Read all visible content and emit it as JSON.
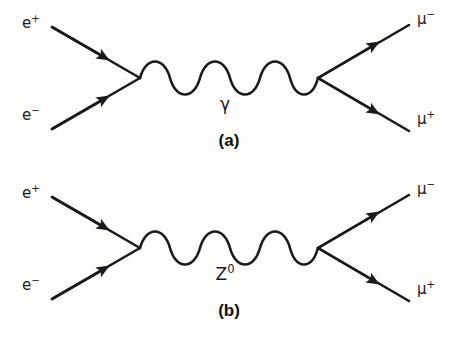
{
  "figure": {
    "background_color": "#fdfdfc",
    "ink_color": "#1a1a1a",
    "process": "e+ e- -> mu+ mu-"
  },
  "diagrams": [
    {
      "id": "a",
      "caption": "(a)",
      "propagator": {
        "particle": "γ",
        "superscript": "",
        "type": "wavy",
        "cycles": 3
      },
      "incoming": [
        {
          "label": "e",
          "charge": "+",
          "position": "upper-left",
          "arrow": "toward-vertex"
        },
        {
          "label": "e",
          "charge": "−",
          "position": "lower-left",
          "arrow": "toward-vertex"
        }
      ],
      "outgoing": [
        {
          "label": "μ",
          "charge": "−",
          "position": "upper-right",
          "arrow": "away-from-vertex"
        },
        {
          "label": "μ",
          "charge": "+",
          "position": "lower-right",
          "arrow": "away-from-vertex"
        }
      ]
    },
    {
      "id": "b",
      "caption": "(b)",
      "propagator": {
        "particle": "Z",
        "superscript": "0",
        "type": "wavy",
        "cycles": 3
      },
      "incoming": [
        {
          "label": "e",
          "charge": "+",
          "position": "upper-left",
          "arrow": "toward-vertex"
        },
        {
          "label": "e",
          "charge": "−",
          "position": "lower-left",
          "arrow": "toward-vertex"
        }
      ],
      "outgoing": [
        {
          "label": "μ",
          "charge": "−",
          "position": "upper-right",
          "arrow": "away-from-vertex"
        },
        {
          "label": "μ",
          "charge": "+",
          "position": "lower-right",
          "arrow": "away-from-vertex"
        }
      ]
    }
  ]
}
